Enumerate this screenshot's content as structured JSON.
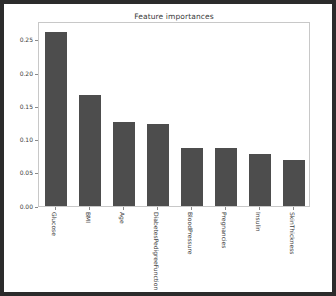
{
  "chart_data": {
    "type": "bar",
    "title": "Feature importances",
    "xlabel": "",
    "ylabel": "",
    "categories": [
      "Glucose",
      "BMI",
      "Age",
      "DiabetesPedigreeFunction",
      "BloodPressure",
      "Pregnancies",
      "Insulin",
      "SkinThickness"
    ],
    "values": [
      0.262,
      0.167,
      0.126,
      0.124,
      0.087,
      0.087,
      0.078,
      0.069
    ],
    "ylim": [
      0.0,
      0.2785
    ],
    "yticks": [
      0.0,
      0.05,
      0.1,
      0.15,
      0.2,
      0.25
    ],
    "ytick_labels": [
      "0.00",
      "0.05",
      "0.10",
      "0.15",
      "0.20",
      "0.25"
    ],
    "grid": false,
    "legend": false,
    "bar_color": "#4d4d4d",
    "background_color": "#ffffff",
    "axes_edge_color": "#c8c8c8",
    "frame_color": "#2b2b2b"
  }
}
